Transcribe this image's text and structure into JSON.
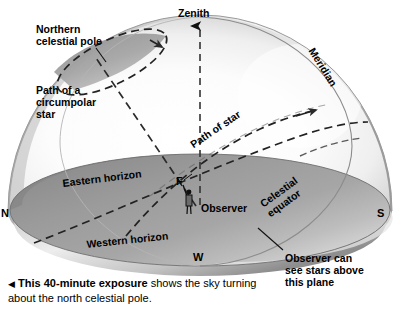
{
  "figure": {
    "type": "astronomy-diagram"
  },
  "labels": {
    "northern_celestial_pole": "Northern\ncelestial pole",
    "path_of_circumpolar_star": "Path of a\ncircumpolar\nstar",
    "zenith": "Zenith",
    "meridian": "Meridian",
    "path_of_star": "Path of star",
    "celestial_equator_line1": "Celestial",
    "celestial_equator_line2": "equator",
    "eastern_horizon": "Eastern horizon",
    "western_horizon": "Western horizon",
    "observer": "Observer",
    "foot_marker": "F",
    "observer_plane_note": "Observer can\nsee stars above\nthis plane"
  },
  "compass": {
    "north": "N",
    "south": "S",
    "west": "W"
  },
  "caption": {
    "arrow": "◀",
    "bold_part": "This 40-minute exposure",
    "rest": " shows the sky turning about the north celestial pole."
  },
  "colors": {
    "background": "#ffffff",
    "dome_light": "#fdfdfd",
    "dome_rim": "#a8a8a8",
    "dome_shadow": "#8f8f8f",
    "horizon_plane": "#9a9a9a",
    "horizon_plane_dark": "#7d7d7d",
    "line": "#1a1a1a",
    "text": "#000000"
  }
}
